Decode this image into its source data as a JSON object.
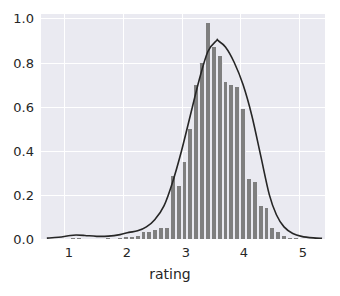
{
  "figure": {
    "background_color": "#ffffff",
    "plot_background_color": "#eaeaf1",
    "grid_color": "#ffffff",
    "bar_color": "#7f7f7f",
    "kde_color": "#262626"
  },
  "axes": {
    "x_title": "rating",
    "y_title": "",
    "x_ticks": [
      "1",
      "2",
      "3",
      "4",
      "5"
    ],
    "y_ticks": [
      "0.0",
      "0.2",
      "0.4",
      "0.6",
      "0.8",
      "1.0"
    ]
  },
  "chart_data": {
    "type": "bar",
    "title": "",
    "xlabel": "rating",
    "ylabel": "",
    "xlim": [
      0.6,
      5.45
    ],
    "ylim": [
      0.0,
      1.02
    ],
    "grid": true,
    "legend": "none",
    "bin_width": 0.1,
    "series": [
      {
        "name": "histogram density",
        "type": "bar",
        "x": [
          1.15,
          1.25,
          1.75,
          1.95,
          2.05,
          2.15,
          2.25,
          2.35,
          2.45,
          2.55,
          2.65,
          2.75,
          2.85,
          2.95,
          3.05,
          3.15,
          3.25,
          3.35,
          3.45,
          3.55,
          3.65,
          3.75,
          3.85,
          3.95,
          4.05,
          4.15,
          4.25,
          4.35,
          4.45,
          4.55,
          4.65,
          4.75,
          4.85,
          4.95
        ],
        "values": [
          0.005,
          0.004,
          0.004,
          0.006,
          0.008,
          0.01,
          0.012,
          0.03,
          0.032,
          0.04,
          0.048,
          0.05,
          0.285,
          0.24,
          0.35,
          0.5,
          0.7,
          0.8,
          0.98,
          0.87,
          0.83,
          0.71,
          0.7,
          0.69,
          0.59,
          0.27,
          0.26,
          0.15,
          0.14,
          0.05,
          0.03,
          0.012,
          0.006,
          0.004
        ]
      },
      {
        "name": "kde",
        "type": "line",
        "x": [
          0.7,
          0.9,
          1.1,
          1.2,
          1.35,
          1.55,
          1.75,
          1.95,
          2.1,
          2.25,
          2.4,
          2.55,
          2.7,
          2.85,
          3.0,
          3.15,
          3.3,
          3.45,
          3.6,
          3.62,
          3.75,
          3.9,
          4.05,
          4.2,
          4.35,
          4.5,
          4.62,
          4.75,
          4.9,
          5.05,
          5.25,
          5.4
        ],
        "values": [
          0.004,
          0.008,
          0.016,
          0.018,
          0.016,
          0.012,
          0.013,
          0.02,
          0.03,
          0.037,
          0.055,
          0.09,
          0.15,
          0.26,
          0.4,
          0.56,
          0.72,
          0.85,
          0.9,
          0.9,
          0.87,
          0.8,
          0.7,
          0.56,
          0.38,
          0.2,
          0.11,
          0.055,
          0.025,
          0.012,
          0.005,
          0.003
        ]
      }
    ]
  }
}
